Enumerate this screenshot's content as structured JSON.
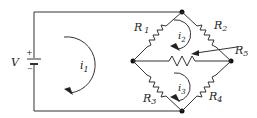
{
  "diagram": {
    "type": "circuit",
    "source": {
      "label": "V",
      "plus": "+",
      "minus": "−"
    },
    "mesh_currents": [
      {
        "label": "i",
        "sub": "1",
        "direction": "clockwise"
      },
      {
        "label": "i",
        "sub": "2",
        "direction": "clockwise"
      },
      {
        "label": "i",
        "sub": "3",
        "direction": "clockwise"
      }
    ],
    "resistors": [
      {
        "label": "R",
        "sub": "1"
      },
      {
        "label": "R",
        "sub": "2"
      },
      {
        "label": "R",
        "sub": "3"
      },
      {
        "label": "R",
        "sub": "4"
      },
      {
        "label": "R",
        "sub": "5"
      }
    ],
    "colors": {
      "line": "#333333",
      "background": "#ffffff"
    }
  }
}
